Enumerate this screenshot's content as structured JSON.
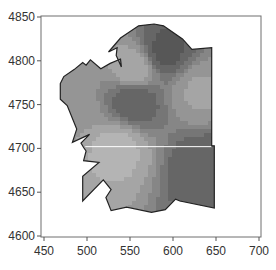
{
  "chart_data": {
    "type": "heatmap",
    "title": "",
    "xlabel": "",
    "ylabel": "",
    "xlim": [
      450,
      700
    ],
    "ylim": [
      4600,
      4850
    ],
    "x_ticks": [
      450,
      500,
      550,
      600,
      650,
      700
    ],
    "y_ticks": [
      4600,
      4650,
      4700,
      4750,
      4800,
      4850
    ],
    "x_tick_labels": [
      "450",
      "500",
      "550",
      "600",
      "650",
      "700"
    ],
    "y_tick_labels": [
      "4600",
      "4650",
      "4700",
      "4750",
      "4800",
      "4850"
    ],
    "grid": false,
    "legend": "none",
    "colormap": "grayscale",
    "boundary_polygon": [
      [
        525,
        4810
      ],
      [
        539,
        4826
      ],
      [
        560,
        4840
      ],
      [
        578,
        4842
      ],
      [
        589,
        4840
      ],
      [
        611,
        4825
      ],
      [
        622,
        4813
      ],
      [
        645,
        4815
      ],
      [
        645,
        4703
      ],
      [
        648,
        4703
      ],
      [
        648,
        4632
      ],
      [
        608,
        4640
      ],
      [
        603,
        4642
      ],
      [
        591,
        4630
      ],
      [
        575,
        4627
      ],
      [
        546,
        4633
      ],
      [
        528,
        4629
      ],
      [
        522,
        4644
      ],
      [
        528,
        4653
      ],
      [
        519,
        4664
      ],
      [
        495,
        4640
      ],
      [
        495,
        4668
      ],
      [
        514,
        4684
      ],
      [
        496,
        4686
      ],
      [
        499,
        4697
      ],
      [
        496,
        4701
      ],
      [
        493,
        4706
      ],
      [
        503,
        4716
      ],
      [
        483,
        4707
      ],
      [
        488,
        4722
      ],
      [
        477,
        4749
      ],
      [
        469,
        4756
      ],
      [
        469,
        4774
      ],
      [
        473,
        4782
      ],
      [
        485,
        4790
      ],
      [
        495,
        4798
      ],
      [
        499,
        4795
      ],
      [
        504,
        4801
      ],
      [
        516,
        4791
      ],
      [
        527,
        4797
      ],
      [
        539,
        4802
      ],
      [
        540,
        4793
      ],
      [
        534,
        4806
      ],
      [
        535,
        4815
      ],
      [
        525,
        4810
      ]
    ],
    "reference_line": {
      "y": 4702,
      "x_range": [
        498,
        645
      ],
      "color": "#ffffff"
    },
    "value_regions": [
      {
        "name": "north-dark-ridge",
        "center": [
          590,
          4810
        ],
        "level": 0.15
      },
      {
        "name": "west-central-dark",
        "center": [
          555,
          4755
        ],
        "level": 0.2
      },
      {
        "name": "southeast-dark",
        "center": [
          635,
          4680
        ],
        "level": 0.2
      },
      {
        "name": "southwest-light",
        "center": [
          535,
          4700
        ],
        "level": 0.85
      },
      {
        "name": "northwest-light",
        "center": [
          555,
          4790
        ],
        "level": 0.8
      },
      {
        "name": "east-light-band",
        "center": [
          630,
          4765
        ],
        "level": 0.7
      },
      {
        "name": "far-west-mid",
        "center": [
          480,
          4750
        ],
        "level": 0.65
      }
    ],
    "colors": {
      "dark": "#474747",
      "light": "#c4c4c4",
      "outline": "#222222",
      "axis": "#555555"
    }
  }
}
